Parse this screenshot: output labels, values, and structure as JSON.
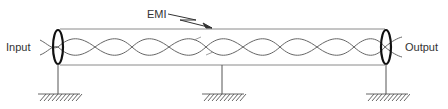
{
  "diagram": {
    "type": "shielded-twisted-pair-cable",
    "labels": {
      "input": "Input",
      "output": "Output",
      "emi": "EMI"
    },
    "colors": {
      "line": "#555555",
      "shield": "#111111",
      "background": "#ffffff"
    },
    "components": [
      {
        "name": "input-shield-termination",
        "position": "left"
      },
      {
        "name": "cable-shield",
        "position": "span"
      },
      {
        "name": "twisted-pair",
        "position": "inside-shield"
      },
      {
        "name": "output-shield-termination",
        "position": "right"
      },
      {
        "name": "ground-left"
      },
      {
        "name": "ground-middle"
      },
      {
        "name": "ground-right"
      },
      {
        "name": "emi-arrow",
        "position": "top-center"
      }
    ]
  }
}
